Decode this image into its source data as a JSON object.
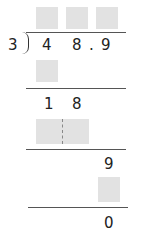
{
  "problem": {
    "divisor": "3",
    "dividend_digits": [
      "4",
      "8",
      ".",
      "9"
    ],
    "quotient_boxes": [
      "blank",
      "blank",
      "blank"
    ]
  },
  "steps": {
    "step1_product_box": "blank",
    "step2_remainder_digits": [
      "1",
      "8"
    ],
    "step2_product_box": "blank",
    "step3_bring_down": "9",
    "step3_product_box": "blank",
    "final_remainder": "0"
  },
  "colors": {
    "box_fill": "#e2e2e2",
    "line": "#555555",
    "text": "#222222"
  }
}
